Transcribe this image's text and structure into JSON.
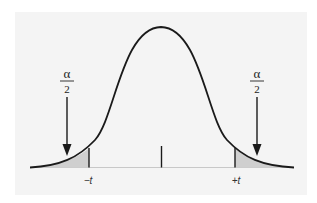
{
  "diagram": {
    "type": "two-tailed t-distribution",
    "colors": {
      "panel_bg": "#f4f4f4",
      "curve": "#1a1a1a",
      "tail_shade": "#cfcfcf",
      "baseline": "#c8c8c8"
    },
    "left_tail": {
      "annotation_numerator": "α",
      "annotation_denominator": "2",
      "tick_label": "−t"
    },
    "right_tail": {
      "annotation_numerator": "α",
      "annotation_denominator": "2",
      "tick_label": "+t"
    }
  }
}
